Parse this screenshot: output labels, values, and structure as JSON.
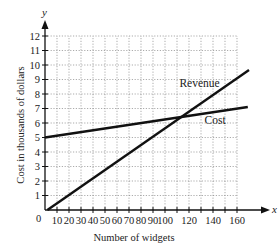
{
  "chart_data": {
    "type": "line",
    "title": "",
    "xlabel": "Number of widgets",
    "ylabel": "Cost in thousands of dollars",
    "x_axis_letter": "x",
    "y_axis_letter": "y",
    "origin_label": "0",
    "xlim": [
      0,
      175
    ],
    "ylim": [
      0,
      13
    ],
    "x_ticks": [
      10,
      20,
      30,
      40,
      50,
      60,
      70,
      80,
      90,
      100,
      110,
      120,
      130,
      140,
      150,
      160
    ],
    "x_tick_labels": [
      "10",
      "20",
      "30",
      "40",
      "50",
      "60",
      "70",
      "80",
      "90",
      "100",
      "120",
      "140",
      "160"
    ],
    "x_tick_label_values": [
      10,
      20,
      30,
      40,
      50,
      60,
      70,
      80,
      90,
      100,
      120,
      140,
      160
    ],
    "y_ticks": [
      1,
      2,
      3,
      4,
      5,
      6,
      7,
      8,
      9,
      10,
      11,
      12
    ],
    "y_tick_labels": [
      "1",
      "2",
      "3",
      "4",
      "5",
      "6",
      "7",
      "8",
      "9",
      "10",
      "11",
      "12"
    ],
    "grid": true,
    "grid_style": "dotted",
    "legend": "inline labels",
    "series": [
      {
        "name": "Revenue",
        "label_position": {
          "x": 112,
          "y": 8.5
        },
        "points": [
          {
            "x": 2,
            "y": 0
          },
          {
            "x": 170,
            "y": 9.65
          }
        ]
      },
      {
        "name": "Cost",
        "label_position": {
          "x": 133,
          "y": 5.9
        },
        "points": [
          {
            "x": 0,
            "y": 5
          },
          {
            "x": 169,
            "y": 7.1
          }
        ]
      }
    ],
    "annotations": [
      {
        "text": "Break-even intersection (unlabeled)",
        "x": 114,
        "y": 6.3
      }
    ]
  }
}
